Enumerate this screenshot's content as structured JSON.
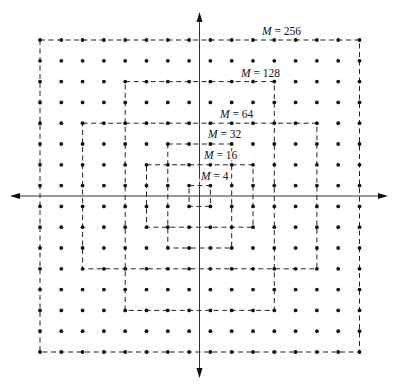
{
  "figure": {
    "type": "QAM constellation diagram",
    "grid": {
      "columns": 16,
      "rows": 16,
      "x0": 40,
      "y0": 40,
      "dx": 21.3,
      "dy": 20.8,
      "dot_color": "#111111",
      "dot_radius": 1.9
    },
    "axes": {
      "origin_x": 199.5,
      "origin_y": 196,
      "x_min": 10,
      "x_max": 388,
      "y_min": 12,
      "y_max": 378,
      "color": "#333333"
    },
    "constellations": [
      {
        "label": "M = 4",
        "M": 4,
        "c0": 7,
        "c1": 8,
        "r0": 7,
        "r1": 8,
        "label_x": 201,
        "label_y": 180
      },
      {
        "label": "M = 16",
        "M": 16,
        "c0": 5,
        "c1": 10,
        "r0": 6,
        "r1": 9,
        "label_x": 204,
        "label_y": 159
      },
      {
        "label": "M = 32",
        "M": 32,
        "c0": 6,
        "c1": 9,
        "r0": 5,
        "r1": 10,
        "label_x": 208,
        "label_y": 138
      },
      {
        "label": "M = 64",
        "M": 64,
        "c0": 2,
        "c1": 13,
        "r0": 4,
        "r1": 11,
        "label_x": 220,
        "label_y": 118
      },
      {
        "label": "M = 128",
        "M": 128,
        "c0": 4,
        "c1": 11,
        "r0": 2,
        "r1": 13,
        "label_x": 241,
        "label_y": 77
      },
      {
        "label": "M = 256",
        "M": 256,
        "c0": 0,
        "c1": 15,
        "r0": 0,
        "r1": 15,
        "label_x": 262,
        "label_y": 35
      }
    ],
    "boundary_color": "#222222"
  }
}
